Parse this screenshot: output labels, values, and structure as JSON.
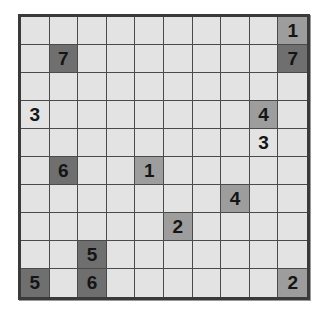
{
  "puzzle": {
    "rows": 10,
    "cols": 10,
    "colors": {
      "empty": "#e3e3e3",
      "dark": "#6f6f6f",
      "mid": "#9d9d9d",
      "grid_line": "#4a4a4a",
      "border": "#3a3a3a"
    },
    "clues": [
      {
        "row": 0,
        "col": 9,
        "value": "1",
        "shade": "mid"
      },
      {
        "row": 1,
        "col": 1,
        "value": "7",
        "shade": "dark"
      },
      {
        "row": 1,
        "col": 9,
        "value": "7",
        "shade": "dark"
      },
      {
        "row": 3,
        "col": 0,
        "value": "3",
        "shade": "plain"
      },
      {
        "row": 3,
        "col": 8,
        "value": "4",
        "shade": "mid"
      },
      {
        "row": 4,
        "col": 8,
        "value": "3",
        "shade": "plain"
      },
      {
        "row": 5,
        "col": 1,
        "value": "6",
        "shade": "dark"
      },
      {
        "row": 5,
        "col": 4,
        "value": "1",
        "shade": "mid"
      },
      {
        "row": 6,
        "col": 7,
        "value": "4",
        "shade": "mid"
      },
      {
        "row": 7,
        "col": 5,
        "value": "2",
        "shade": "mid"
      },
      {
        "row": 8,
        "col": 2,
        "value": "5",
        "shade": "dark"
      },
      {
        "row": 9,
        "col": 0,
        "value": "5",
        "shade": "dark"
      },
      {
        "row": 9,
        "col": 2,
        "value": "6",
        "shade": "dark"
      },
      {
        "row": 9,
        "col": 9,
        "value": "2",
        "shade": "mid"
      }
    ]
  }
}
